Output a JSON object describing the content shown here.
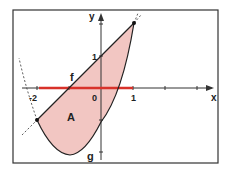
{
  "diagram": {
    "type": "function-area-plot",
    "axes": {
      "x_label": "x",
      "y_label": "y"
    },
    "ticks": {
      "x_minus2": "-2",
      "x_0": "0",
      "x_1": "1",
      "y_1": "1"
    },
    "curves": {
      "line_label": "f",
      "parabola_label": "g"
    },
    "region_label": "A",
    "intersection_points": [
      [
        -2,
        -1
      ],
      [
        1,
        2
      ]
    ],
    "colors": {
      "fill": "#f2c6c2",
      "highlight_interval": "#d8322a",
      "lines": "#222222"
    },
    "highlight_interval": [
      -2,
      1
    ]
  }
}
